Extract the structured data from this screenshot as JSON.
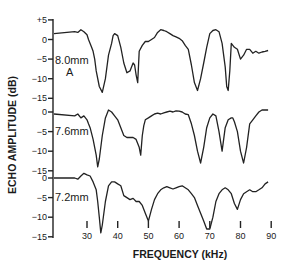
{
  "chart_data": {
    "type": "line",
    "title": "",
    "xlabel": "FREQUENCY (kHz)",
    "ylabel": "ECHO AMPLITUDE (dB)",
    "xlim": [
      25,
      90
    ],
    "x_ticks": [
      30,
      40,
      50,
      60,
      70,
      80,
      90
    ],
    "grid": false,
    "legend": "none (panel labels inline)",
    "layout": "three vertically stacked panels sharing x-axis",
    "panels": [
      {
        "label": "8.0mm",
        "sublabel": "A",
        "ylim": [
          -15,
          5
        ],
        "y_ticks": [
          "+5",
          "0",
          "-5",
          "-10",
          "-15"
        ],
        "series": {
          "name": "8.0mm",
          "x": [
            25,
            26,
            27,
            28,
            29,
            30,
            30.5,
            31,
            31.5,
            32,
            32.5,
            33,
            34,
            35,
            36,
            37,
            38,
            38.5,
            39,
            40,
            41,
            42,
            43,
            44,
            45,
            45.5,
            46,
            46.5,
            47,
            48,
            49,
            50,
            51,
            52,
            53,
            54,
            55,
            56,
            57,
            58,
            59,
            60,
            61,
            62,
            63,
            64,
            65,
            66,
            67,
            68,
            69,
            70,
            71,
            72,
            73,
            74,
            75,
            75.5,
            76,
            76.5,
            77,
            78,
            79,
            80,
            81,
            82,
            83,
            84,
            85,
            86,
            87,
            88,
            89
          ],
          "y": [
            1.5,
            2,
            1.8,
            2.5,
            2,
            1.2,
            0,
            -1,
            -2,
            -3,
            -5,
            -8,
            -12,
            -13.5,
            -10,
            -4,
            -1,
            1,
            1.5,
            1,
            -2,
            -6,
            -8.5,
            -8,
            -6,
            -6.5,
            -9,
            -11,
            -3,
            -1.5,
            -0.5,
            -0.5,
            0,
            0.5,
            1.8,
            2.5,
            2.3,
            2.0,
            1.5,
            1.0,
            0.7,
            0.3,
            -0.3,
            -1.5,
            -2.5,
            -6.5,
            -11,
            -13,
            -10,
            -6,
            -2,
            1.5,
            2.3,
            2.5,
            2.0,
            -1,
            -7,
            -12,
            -13,
            -8,
            -1,
            -2,
            -2.5,
            -5,
            -4,
            -2.5,
            -2.5,
            -3.5,
            -3,
            -3.5,
            -3.2,
            -3,
            -2.8
          ]
        }
      },
      {
        "label": "7.6mm",
        "ylim": [
          -15,
          0
        ],
        "y_ticks": [
          "0",
          "-5",
          "-10",
          "-15"
        ],
        "series": {
          "name": "7.6mm",
          "x": [
            25,
            26,
            27,
            28,
            29,
            30,
            30.5,
            31,
            32,
            33,
            33.5,
            34,
            35,
            36,
            37,
            38,
            39,
            40,
            41,
            42,
            43,
            44,
            45,
            46,
            47,
            47.5,
            48,
            48.5,
            49,
            50,
            51,
            52,
            53,
            54,
            55,
            56,
            57,
            58,
            59,
            60,
            61,
            62,
            63,
            64,
            65,
            66,
            67,
            68,
            69,
            70,
            71,
            72,
            73,
            74,
            75,
            76,
            77,
            77.5,
            78,
            79,
            80,
            81,
            82,
            83,
            84,
            85,
            86,
            87,
            88,
            89
          ],
          "y": [
            -0.5,
            -1,
            -0.5,
            -1.5,
            -1,
            -2,
            -3,
            -4,
            -7,
            -11,
            -14,
            -12,
            -6,
            -1.5,
            0.5,
            0,
            -1,
            -2,
            -4,
            -6,
            -6.5,
            -6.5,
            -6.5,
            -7,
            -9,
            -11,
            -6,
            -3.5,
            -2,
            -1.5,
            -1,
            -0.5,
            -0.3,
            -0.5,
            -0.2,
            0,
            0.2,
            0,
            0.3,
            0.2,
            0,
            -0.5,
            -0.7,
            -3,
            -6,
            -10,
            -13,
            -9,
            -4,
            -1.5,
            -0.5,
            -1,
            -5,
            -10,
            -4,
            -2,
            -1.5,
            -1.5,
            -2.5,
            -5,
            -10,
            -13,
            -9,
            -3,
            -2,
            -1,
            0,
            0.5,
            0.5,
            0.5
          ]
        }
      },
      {
        "label": "7.2mm",
        "ylim": [
          -15,
          0
        ],
        "y_ticks": [
          "0",
          "-5",
          "-10",
          "-15"
        ],
        "series": {
          "name": "7.2mm",
          "x": [
            25,
            26,
            27,
            28,
            29,
            30,
            31,
            32,
            33,
            33.5,
            34,
            34.5,
            35,
            36,
            37,
            38,
            39,
            40,
            41,
            42,
            43,
            44,
            45,
            46,
            47,
            48,
            49,
            50,
            51,
            52,
            53,
            54,
            55,
            56,
            57,
            58,
            59,
            60,
            61,
            62,
            63,
            64,
            65,
            66,
            67,
            68,
            69,
            70,
            71,
            72,
            73,
            74,
            75,
            76,
            77,
            78,
            79,
            80,
            81,
            82,
            83,
            84,
            85,
            86,
            87,
            88,
            89
          ],
          "y": [
            0,
            0,
            -0.3,
            0.5,
            1.2,
            0.8,
            0.5,
            -1,
            -3,
            -6,
            -10,
            -14,
            -12,
            -6,
            -2,
            -1,
            -1,
            -1.5,
            -2,
            -4.5,
            -5,
            -5.5,
            -5.2,
            -6,
            -6,
            -7,
            -9,
            -11,
            -8,
            -5.5,
            -4,
            -3,
            -2.5,
            -2.2,
            -2.5,
            -2.8,
            -2.5,
            -2.2,
            -2,
            -2.5,
            -3,
            -4,
            -5,
            -7,
            -9,
            -11,
            -13,
            -13,
            -10,
            -6,
            -4,
            -3,
            -2.5,
            -3,
            -4,
            -6.5,
            -8,
            -5.5,
            -4,
            -3.5,
            -3,
            -3.5,
            -3.5,
            -3,
            -2.5,
            -1.5,
            -1
          ]
        }
      }
    ]
  }
}
